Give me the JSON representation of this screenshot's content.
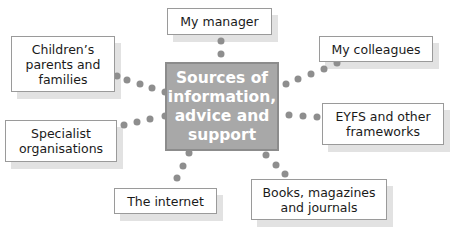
{
  "diagram": {
    "center": {
      "label": "Sources of\ninformation,\nadvice and\nsupport"
    },
    "nodes": [
      {
        "id": "my-manager",
        "label": "My manager"
      },
      {
        "id": "childrens-parents",
        "label": "Children’s\nparents and\nfamilies"
      },
      {
        "id": "my-colleagues",
        "label": "My colleagues"
      },
      {
        "id": "eyfs",
        "label": "EYFS and other\nframeworks"
      },
      {
        "id": "specialist",
        "label": "Specialist\norganisations"
      },
      {
        "id": "internet",
        "label": "The internet"
      },
      {
        "id": "books",
        "label": "Books, magazines\nand journals"
      }
    ]
  },
  "colors": {
    "center_fill": "#a8a8a8",
    "center_border": "#8c8c8c",
    "dot": "#8e8e8e",
    "shadow": "#e2e2e2",
    "box_border": "#9a9a9a"
  }
}
